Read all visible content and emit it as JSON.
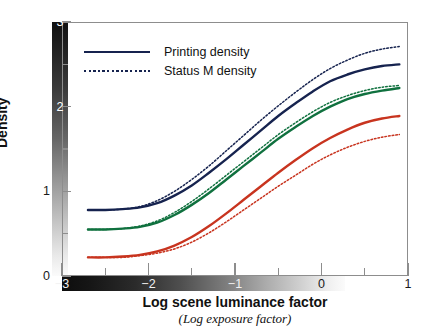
{
  "chart_data": {
    "type": "line",
    "title": "",
    "xlabel": "Log scene luminance factor",
    "xlabel_sub": "(Log exposure factor)",
    "ylabel": "Density",
    "xlim": [
      -3,
      1
    ],
    "ylim": [
      0,
      3
    ],
    "xticks": [
      -3,
      -2.5,
      -2,
      -1.5,
      -1,
      -0.5,
      0,
      0.5,
      1
    ],
    "xtick_labels": [
      "−3",
      "",
      "−2",
      "",
      "−1",
      "",
      "0",
      "",
      "1"
    ],
    "yticks": [
      0,
      0.5,
      1,
      1.5,
      2,
      2.5,
      3
    ],
    "ytick_labels": [
      "0",
      "",
      "1",
      "",
      "2",
      "",
      "3"
    ],
    "grid": false,
    "legend_position": "upper-left",
    "axis_gradient_x": "black-to-white",
    "axis_gradient_y": "white-at-bottom-to-black-at-top",
    "legend": [
      {
        "label": "Printing density",
        "style": "solid"
      },
      {
        "label": "Status M density",
        "style": "dotted"
      }
    ],
    "colors": {
      "blue": "#16234f",
      "green": "#10713f",
      "red": "#c8341f",
      "axis": "#8d8d8d",
      "text": "#111111"
    },
    "series": [
      {
        "name": "Blue printing density",
        "channel": "blue",
        "style": "solid",
        "color": "#16234f",
        "x": [
          -2.7,
          -2.5,
          -2.3,
          -2.1,
          -1.9,
          -1.7,
          -1.5,
          -1.3,
          -1.1,
          -0.9,
          -0.7,
          -0.5,
          -0.3,
          -0.1,
          0.1,
          0.3,
          0.5,
          0.7,
          0.9
        ],
        "y": [
          0.78,
          0.78,
          0.79,
          0.81,
          0.86,
          0.95,
          1.07,
          1.22,
          1.38,
          1.55,
          1.72,
          1.89,
          2.04,
          2.18,
          2.3,
          2.38,
          2.44,
          2.48,
          2.5
        ]
      },
      {
        "name": "Blue status M density",
        "channel": "blue",
        "style": "dotted",
        "color": "#16234f",
        "x": [
          -2.7,
          -2.5,
          -2.3,
          -2.1,
          -1.9,
          -1.7,
          -1.5,
          -1.3,
          -1.1,
          -0.9,
          -0.7,
          -0.5,
          -0.3,
          -0.1,
          0.1,
          0.3,
          0.5,
          0.7,
          0.9
        ],
        "y": [
          0.78,
          0.78,
          0.79,
          0.82,
          0.89,
          1.0,
          1.14,
          1.3,
          1.48,
          1.66,
          1.84,
          2.01,
          2.17,
          2.32,
          2.45,
          2.55,
          2.63,
          2.68,
          2.71
        ]
      },
      {
        "name": "Green printing density",
        "channel": "green",
        "style": "solid",
        "color": "#10713f",
        "x": [
          -2.7,
          -2.5,
          -2.3,
          -2.1,
          -1.9,
          -1.7,
          -1.5,
          -1.3,
          -1.1,
          -0.9,
          -0.7,
          -0.5,
          -0.3,
          -0.1,
          0.1,
          0.3,
          0.5,
          0.7,
          0.9
        ],
        "y": [
          0.55,
          0.55,
          0.56,
          0.58,
          0.63,
          0.72,
          0.84,
          0.98,
          1.14,
          1.3,
          1.46,
          1.62,
          1.76,
          1.89,
          2.0,
          2.09,
          2.15,
          2.19,
          2.22
        ]
      },
      {
        "name": "Green status M density",
        "channel": "green",
        "style": "dotted",
        "color": "#10713f",
        "x": [
          -2.7,
          -2.5,
          -2.3,
          -2.1,
          -1.9,
          -1.7,
          -1.5,
          -1.3,
          -1.1,
          -0.9,
          -0.7,
          -0.5,
          -0.3,
          -0.1,
          0.1,
          0.3,
          0.5,
          0.7,
          0.9
        ],
        "y": [
          0.55,
          0.55,
          0.56,
          0.59,
          0.65,
          0.75,
          0.88,
          1.03,
          1.19,
          1.35,
          1.51,
          1.67,
          1.81,
          1.94,
          2.05,
          2.13,
          2.19,
          2.23,
          2.25
        ]
      },
      {
        "name": "Red printing density",
        "channel": "red",
        "style": "solid",
        "color": "#c8341f",
        "x": [
          -2.7,
          -2.5,
          -2.3,
          -2.1,
          -1.9,
          -1.7,
          -1.5,
          -1.3,
          -1.1,
          -0.9,
          -0.7,
          -0.5,
          -0.3,
          -0.1,
          0.1,
          0.3,
          0.5,
          0.7,
          0.9
        ],
        "y": [
          0.22,
          0.22,
          0.23,
          0.25,
          0.29,
          0.36,
          0.46,
          0.59,
          0.74,
          0.9,
          1.06,
          1.22,
          1.37,
          1.51,
          1.63,
          1.73,
          1.81,
          1.86,
          1.89
        ]
      },
      {
        "name": "Red status M density",
        "channel": "red",
        "style": "dotted",
        "color": "#c8341f",
        "x": [
          -2.7,
          -2.5,
          -2.3,
          -2.1,
          -1.9,
          -1.7,
          -1.5,
          -1.3,
          -1.1,
          -0.9,
          -0.7,
          -0.5,
          -0.3,
          -0.1,
          0.1,
          0.3,
          0.5,
          0.7,
          0.9
        ],
        "y": [
          0.22,
          0.22,
          0.22,
          0.24,
          0.27,
          0.32,
          0.4,
          0.51,
          0.64,
          0.78,
          0.92,
          1.06,
          1.19,
          1.32,
          1.43,
          1.52,
          1.59,
          1.64,
          1.67
        ]
      }
    ]
  }
}
